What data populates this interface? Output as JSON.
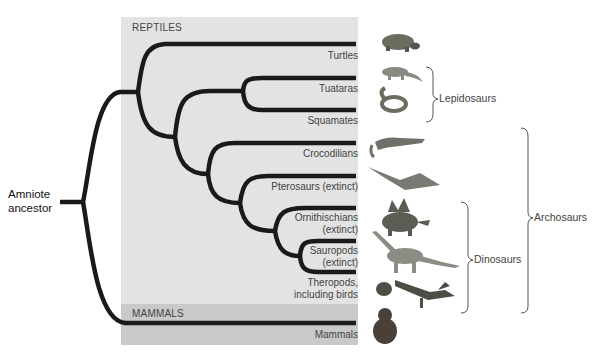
{
  "diagram": {
    "type": "phylogenetic-tree",
    "root_label": [
      "Amniote",
      "ancestor"
    ],
    "groups": [
      {
        "label": "REPTILES",
        "color": "#e3e3e3"
      },
      {
        "label": "MAMMALS",
        "color": "#c9c9c9"
      }
    ],
    "taxa": [
      {
        "label": "Turtles",
        "animal": "turtle-illustration"
      },
      {
        "label": "Tuataras",
        "animal": "tuatara-illustration"
      },
      {
        "label": "Squamates",
        "animal": "snake-illustration"
      },
      {
        "label": "Crocodilians",
        "animal": "crocodile-illustration"
      },
      {
        "label": "Pterosaurs (extinct)",
        "animal": "pterosaur-illustration"
      },
      {
        "label": [
          "Ornithischians",
          "(extinct)"
        ],
        "animal": "stegosaurus-illustration"
      },
      {
        "label": [
          "Sauropods",
          "(extinct)"
        ],
        "animal": "sauropod-illustration"
      },
      {
        "label": [
          "Theropods,",
          "including birds"
        ],
        "animal": "theropod-and-bird-illustration"
      },
      {
        "label": "Mammals",
        "animal": "chimpanzee-illustration"
      }
    ],
    "clades": [
      {
        "label": "Lepidosaurs",
        "members": [
          "Tuataras",
          "Squamates"
        ]
      },
      {
        "label": "Dinosaurs",
        "members": [
          "Ornithischians",
          "Sauropods",
          "Theropods"
        ]
      },
      {
        "label": "Archosaurs",
        "members": [
          "Crocodilians",
          "Pterosaurs",
          "Ornithischians",
          "Sauropods",
          "Theropods"
        ]
      }
    ],
    "line_color": "#1a1a1a"
  }
}
